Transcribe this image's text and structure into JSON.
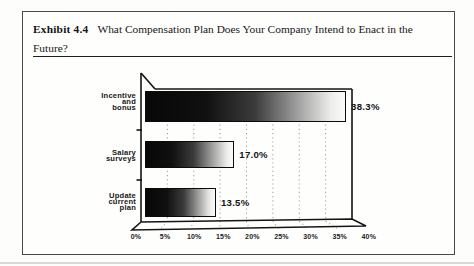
{
  "exhibit": {
    "label": "Exhibit 4.4",
    "title_line1": "What Compensation Plan Does Your Company Intend to Enact in the",
    "title_line2": "Future?"
  },
  "chart_data": {
    "type": "bar",
    "orientation": "horizontal",
    "style": "3d-perspective-frame, bars shaded dark-to-light left-to-right",
    "categories": [
      "Incentive and bonus",
      "Salary surveys",
      "Update current plan"
    ],
    "category_lines": [
      [
        "Incentive",
        "and",
        "bonus"
      ],
      [
        "Salary",
        "surveys"
      ],
      [
        "Update",
        "current",
        "plan"
      ]
    ],
    "values": [
      38.3,
      17.0,
      13.5
    ],
    "value_labels": [
      "38.3%",
      "17.0%",
      "13.5%"
    ],
    "x_ticks": [
      "0%",
      "5%",
      "10%",
      "15%",
      "20%",
      "25%",
      "30%",
      "35%",
      "40%"
    ],
    "xlim": [
      0,
      40
    ],
    "xlabel": "",
    "ylabel": "",
    "grid": "dotted vertical gridlines at 5% steps",
    "colors": {
      "frame": "#141414",
      "gridline": "#a5a5a5",
      "bar_dark_end": "#070707",
      "bar_light_end": "#fbfbfa",
      "text": "#181818",
      "paper": "#fdfdfc"
    }
  }
}
